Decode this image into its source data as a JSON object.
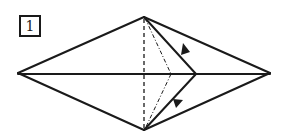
{
  "step": {
    "number": "1"
  },
  "diagram": {
    "colors": {
      "line": "#1a1a1a",
      "background": "#ffffff"
    },
    "vertices": {
      "left_tip": [
        18,
        73
      ],
      "right_tip": [
        270,
        73
      ],
      "top": [
        144,
        17
      ],
      "bottom": [
        144,
        130
      ],
      "fold_point": [
        196,
        74
      ],
      "fold_hidden_point": [
        171,
        74
      ]
    },
    "lines": [
      {
        "name": "outline-top-left",
        "style": "solid"
      },
      {
        "name": "outline-bottom-left",
        "style": "solid"
      },
      {
        "name": "outline-top-right",
        "style": "solid"
      },
      {
        "name": "outline-bottom-right",
        "style": "solid"
      },
      {
        "name": "centerline",
        "style": "solid"
      },
      {
        "name": "fold-edge-top",
        "style": "solid"
      },
      {
        "name": "fold-edge-bottom",
        "style": "solid"
      },
      {
        "name": "vertical-crease",
        "style": "dashed"
      },
      {
        "name": "hidden-fold-top",
        "style": "dash-dot"
      },
      {
        "name": "hidden-fold-bottom",
        "style": "dash-dot"
      }
    ],
    "arrows": [
      {
        "name": "arrow-upper",
        "position": [
          181,
          48
        ],
        "direction": "down-right"
      },
      {
        "name": "arrow-lower",
        "position": [
          174,
          101
        ],
        "direction": "up-right"
      }
    ]
  }
}
